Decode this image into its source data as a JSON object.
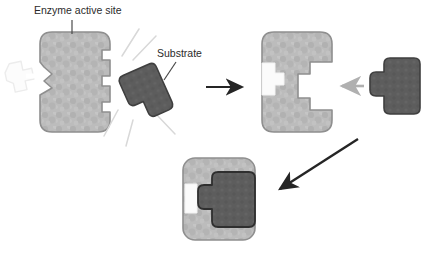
{
  "diagram": {
    "background_color": "#ffffff",
    "labels": [
      {
        "id": "enzyme-active-site",
        "text": "Enzyme active site",
        "x": 34,
        "y": 14
      },
      {
        "id": "substrate",
        "text": "Substrate",
        "x": 157,
        "y": 57
      }
    ],
    "colors": {
      "enzyme_fill": "#b7b7b7",
      "enzyme_fill_light": "#c4c4c4",
      "enzyme_stroke": "#8a8a8a",
      "substrate_fill": "#5d5d5d",
      "substrate_stroke": "#3f3f3f",
      "ghost_fill": "#fbfbfb",
      "ghost_stroke": "#ededed",
      "arrow_black": "#252525",
      "arrow_gray": "#b0b0b0",
      "arrow_white": "#ffffff",
      "leader_line": "#4a4a4a",
      "motion_line": "#d6d6d6",
      "label_text": "#2b2b2b"
    },
    "panels": [
      {
        "id": "panel-1-unbound",
        "name": "enzyme-and-free-substrate",
        "enzyme": {
          "name": "enzyme-body-1",
          "x": 40,
          "y": 32,
          "width": 70,
          "height": 100,
          "notch_side": "right",
          "notch_count": 3
        },
        "substrate": {
          "name": "substrate-free",
          "x": 126,
          "y": 66,
          "rotation": -22,
          "state": "unbound"
        },
        "ghost_substrate": {
          "name": "ghost-substrate",
          "x": 6,
          "y": 60,
          "state": "outline-only"
        },
        "motion_lines": 5
      },
      {
        "id": "panel-2-approach",
        "name": "enzyme-with-open-cavity",
        "enzyme": {
          "name": "enzyme-body-2",
          "x": 262,
          "y": 32,
          "width": 70,
          "height": 100,
          "notch_side": "right",
          "cavity": "large"
        },
        "substrate": {
          "name": "substrate-approaching",
          "x": 372,
          "y": 60,
          "rotation": 0,
          "state": "approaching"
        },
        "white_block": {
          "name": "product-block-2",
          "x": 262,
          "y": 62
        }
      },
      {
        "id": "panel-3-bound",
        "name": "enzyme-substrate-complex",
        "enzyme": {
          "name": "enzyme-body-3",
          "x": 183,
          "y": 158,
          "width": 72,
          "height": 82
        },
        "substrate": {
          "name": "substrate-bound",
          "x": 212,
          "y": 172,
          "rotation": 0,
          "state": "bound"
        },
        "white_block": {
          "name": "product-block-3",
          "x": 190,
          "y": 184
        }
      }
    ],
    "arrows": [
      {
        "id": "arrow-step-1-to-2",
        "name": "arrow-right-black",
        "direction": "right",
        "color": "#252525",
        "x1": 206,
        "y1": 87,
        "x2": 248,
        "y2": 87
      },
      {
        "id": "arrow-substrate-entry",
        "name": "arrow-left-gray",
        "direction": "left",
        "color": "#b0b0b0",
        "x1": 362,
        "y1": 86,
        "x2": 336,
        "y2": 86
      },
      {
        "id": "arrow-step-2-to-3",
        "name": "arrow-diagonal-black",
        "direction": "down-left",
        "color": "#252525",
        "x1": 356,
        "y1": 140,
        "x2": 273,
        "y2": 193
      },
      {
        "id": "arrow-release-white",
        "name": "arrow-right-white",
        "direction": "right",
        "color": "#ffffff",
        "x1": 24,
        "y1": 76,
        "x2": 62,
        "y2": 76
      }
    ]
  }
}
